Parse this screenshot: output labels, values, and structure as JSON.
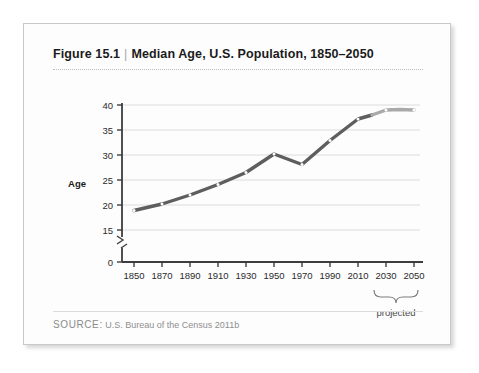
{
  "figure": {
    "label": "Figure 15.1",
    "separator": "|",
    "title": "Median Age, U.S. Population, 1850–2050",
    "source_key": "SOURCE:",
    "source_text": "U.S. Bureau of the Census 2011b"
  },
  "chart_data": {
    "type": "line",
    "title": "Median Age, U.S. Population, 1850–2050",
    "xlabel": "",
    "ylabel": "Age",
    "x": [
      1850,
      1870,
      1890,
      1910,
      1930,
      1950,
      1970,
      1990,
      2010,
      2030,
      2050
    ],
    "values": [
      18.9,
      20.2,
      22.0,
      24.1,
      26.5,
      30.2,
      28.1,
      32.9,
      37.2,
      39.0,
      39.0
    ],
    "series": [
      {
        "name": "Median age (observed)",
        "color": "#5e5e5e",
        "x": [
          1850,
          1870,
          1890,
          1910,
          1930,
          1950,
          1970,
          1990,
          2010,
          2020
        ],
        "values": [
          18.9,
          20.2,
          22.0,
          24.1,
          26.5,
          30.2,
          28.1,
          32.9,
          37.2,
          38.0
        ]
      },
      {
        "name": "Median age (projected)",
        "color": "#a9a9a9",
        "x": [
          2020,
          2030,
          2040,
          2050
        ],
        "values": [
          38.0,
          39.0,
          39.1,
          39.0
        ]
      }
    ],
    "y_ticks": [
      0,
      15,
      20,
      25,
      30,
      35,
      40
    ],
    "x_ticks": [
      1850,
      1870,
      1890,
      1910,
      1930,
      1950,
      1970,
      1990,
      2010,
      2030,
      2050
    ],
    "ylim": [
      15,
      40
    ],
    "xlim": [
      1850,
      2050
    ],
    "axis_break": true,
    "grid": "horizontal",
    "legend": "none",
    "annotations": [
      {
        "text": "projected",
        "span_start": 2030,
        "span_end": 2050,
        "type": "brace-below-axis"
      }
    ]
  },
  "axis": {
    "y_label": "Age",
    "y_ticks": [
      "40",
      "35",
      "30",
      "25",
      "20",
      "15",
      "0"
    ],
    "x_ticks": [
      "1850",
      "1870",
      "1890",
      "1910",
      "1930",
      "1950",
      "1970",
      "1990",
      "2010",
      "2030",
      "2050"
    ],
    "projected_note": "projected"
  },
  "colors": {
    "line_observed": "#5e5e5e",
    "line_projected": "#a9a9a9",
    "grid": "#dcdcdc",
    "axis": "#3d3d3d",
    "card_border": "#c9c9c9",
    "text": "#1b1b1b",
    "muted_text": "#8f8f8f"
  }
}
